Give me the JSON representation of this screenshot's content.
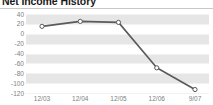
{
  "title": "Net Income History",
  "chart_data": {
    "type": "line",
    "title": "Net Income History",
    "xlabel": "",
    "ylabel": "",
    "categories": [
      "12/03",
      "12/04",
      "12/05",
      "12/06",
      "9/07"
    ],
    "values": [
      15,
      25,
      23,
      -69,
      -113
    ],
    "series": [
      {
        "name": "Net Income",
        "values": [
          15,
          25,
          23,
          -69,
          -113
        ]
      }
    ],
    "yticks": [
      40,
      20,
      0,
      -20,
      -40,
      -60,
      -80,
      -100,
      -120
    ],
    "ytick_labels": [
      "40",
      "20",
      "0",
      "-20",
      "-40",
      "-60",
      "-80",
      "-100",
      "-120"
    ],
    "xtick_labels": [
      "12/03",
      "12/04",
      "12/05",
      "12/06",
      "9/07"
    ],
    "ylim": [
      -120,
      40
    ],
    "grid": true,
    "banded_background": true,
    "legend": null,
    "line_color": "#5a5a5a",
    "marker_fill": "#ffffff",
    "marker_edge": "#5a5a5a",
    "band_color": "#e6e6e6",
    "plot_background": "#ffffff",
    "axis_label_color": "#808080"
  }
}
